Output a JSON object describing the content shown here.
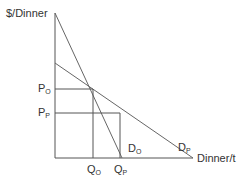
{
  "diagram": {
    "title": "",
    "y_axis_label": "$/Dinner",
    "x_axis_label": "Dinner/t",
    "curves": [
      {
        "name": "D_O",
        "label_main": "D",
        "label_sub": "O",
        "from": [
          55,
          13
        ],
        "to": [
          122,
          158
        ]
      },
      {
        "name": "D_P",
        "label_main": "D",
        "label_sub": "P",
        "from": [
          55,
          63
        ],
        "to": [
          193,
          158
        ]
      }
    ],
    "price_levels": [
      {
        "label_main": "P",
        "label_sub": "O",
        "y": 89
      },
      {
        "label_main": "P",
        "label_sub": "P",
        "y": 113
      }
    ],
    "quantity_levels": [
      {
        "label_main": "Q",
        "label_sub": "O",
        "x": 93
      },
      {
        "label_main": "Q",
        "label_sub": "P",
        "x": 120
      }
    ],
    "colors": {
      "axis": "#555555",
      "curve": "#666666",
      "text": "#333333"
    }
  }
}
